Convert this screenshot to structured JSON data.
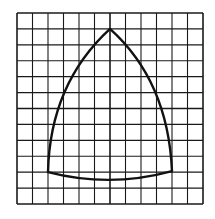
{
  "diagram": {
    "type": "grid-figure",
    "grid": {
      "columns": 12,
      "rows": 12,
      "x0": 17,
      "y0": 13,
      "x1": 203,
      "y1": 204,
      "line_color": "#1a1a1a",
      "background": "#ffffff"
    },
    "shape": {
      "name": "curved-triangle",
      "stroke_color": "#111111",
      "vertices": [
        {
          "name": "apex",
          "col": 6,
          "row": 1
        },
        {
          "name": "bottom-left",
          "col": 2,
          "row": 10
        },
        {
          "name": "bottom-right",
          "col": 10,
          "row": 10
        }
      ],
      "edges": [
        {
          "name": "left-arc",
          "from": "bottom-left",
          "to": "apex",
          "bulge": "outward"
        },
        {
          "name": "right-arc",
          "from": "apex",
          "to": "bottom-right",
          "bulge": "outward"
        },
        {
          "name": "bottom-arc",
          "from": "bottom-right",
          "to": "bottom-left",
          "bulge": "downward"
        }
      ]
    }
  }
}
